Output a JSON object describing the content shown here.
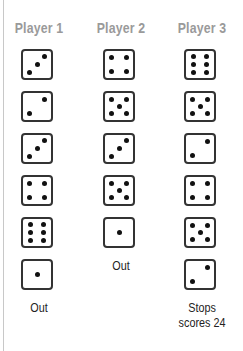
{
  "players": [
    {
      "name": "Player 1",
      "rolls": [
        3,
        2,
        3,
        4,
        6,
        1
      ],
      "outcome": "Out"
    },
    {
      "name": "Player 2",
      "rolls": [
        4,
        5,
        3,
        5,
        1
      ],
      "outcome": "Out"
    },
    {
      "name": "Player 3",
      "rolls": [
        6,
        5,
        2,
        4,
        5,
        2
      ],
      "outcome": "Stops scores 24",
      "outcome_lines": [
        "Stops",
        "scores 24"
      ]
    }
  ],
  "colors": {
    "header": "#9a9a9a",
    "die_border": "#333333",
    "pip": "#111111"
  }
}
